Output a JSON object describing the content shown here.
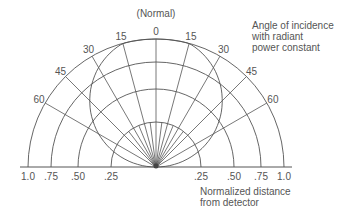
{
  "diagram": {
    "top_label": "(Normal)",
    "angle_labels": [
      "0",
      "15",
      "30",
      "45",
      "60"
    ],
    "angles_deg": [
      0,
      15,
      30,
      45,
      60
    ],
    "distance_labels": [
      "1.0",
      ".75",
      ".50",
      ".25"
    ],
    "distance_values": [
      1.0,
      0.75,
      0.5,
      0.25
    ],
    "lobe_half_angle_deg": 15,
    "annotation_angle": [
      "Angle of incidence",
      "with radiant",
      "power constant"
    ],
    "annotation_distance": [
      "Normalized distance",
      "from detector"
    ],
    "line_color": "#555555"
  }
}
